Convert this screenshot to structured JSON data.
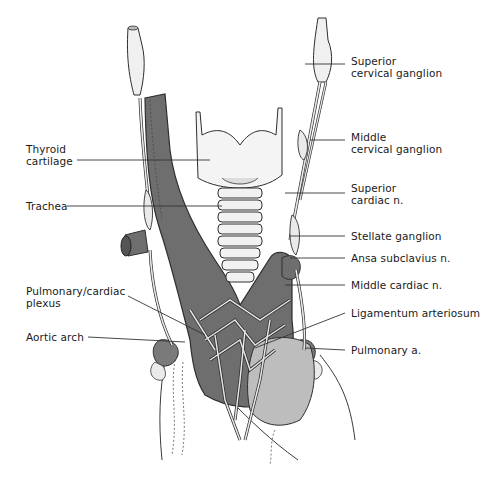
{
  "figure": {
    "colors": {
      "vessel_dark": "#6e6e6e",
      "vessel_outline": "#2e2e2e",
      "nerve_light": "#e8e8e8",
      "cartilage": "#f4f4f4",
      "leader_line": "#333333",
      "label_text": "#1a1a1a"
    },
    "labels_left": [
      {
        "id": "thyroid-cartilage",
        "line1": "Thyroid",
        "line2": "cartilage"
      },
      {
        "id": "trachea",
        "line1": "Trachea",
        "line2": ""
      },
      {
        "id": "pulmonary-cardiac-plexus",
        "line1": "Pulmonary/cardiac",
        "line2": "plexus"
      },
      {
        "id": "aortic-arch",
        "line1": "Aortic arch",
        "line2": ""
      }
    ],
    "labels_right": [
      {
        "id": "superior-cervical-ganglion",
        "line1": "Superior",
        "line2": "cervical ganglion"
      },
      {
        "id": "middle-cervical-ganglion",
        "line1": "Middle",
        "line2": "cervical ganglion"
      },
      {
        "id": "superior-cardiac-n",
        "line1": "Superior",
        "line2": "cardiac n."
      },
      {
        "id": "stellate-ganglion",
        "line1": "Stellate ganglion",
        "line2": ""
      },
      {
        "id": "ansa-subclavius-n",
        "line1": "Ansa subclavius n.",
        "line2": ""
      },
      {
        "id": "middle-cardiac-n",
        "line1": "Middle cardiac n.",
        "line2": ""
      },
      {
        "id": "ligamentum-arteriosum",
        "line1": "Ligamentum arteriosum",
        "line2": ""
      },
      {
        "id": "pulmonary-a",
        "line1": "Pulmonary a.",
        "line2": ""
      }
    ]
  }
}
